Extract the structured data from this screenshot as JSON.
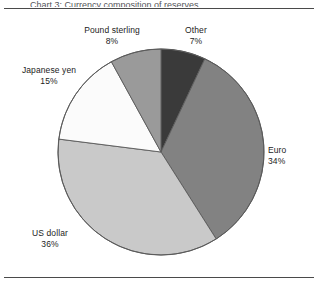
{
  "figure": {
    "title_remnant": "Chart 3: Currency composition of reserves",
    "background": "#ffffff",
    "rule_color": "#4a4a4a"
  },
  "chart_data": {
    "type": "pie",
    "title": "",
    "xlabel": "",
    "ylabel": "",
    "units": "percent",
    "start_angle_deg": 0,
    "direction": "clockwise",
    "legend": "none",
    "labels_placement": "outside-callout",
    "categories": [
      "Other",
      "Euro",
      "US dollar",
      "Japanese yen",
      "Pound sterling"
    ],
    "values": [
      7,
      34,
      36,
      15,
      8
    ],
    "total": 100,
    "slices": [
      {
        "label": "Other",
        "value": 7,
        "value_text": "7%",
        "color": "#3a3a3a",
        "start_deg": 0.0,
        "end_deg": 25.2
      },
      {
        "label": "Euro",
        "value": 34,
        "value_text": "34%",
        "color": "#828282",
        "start_deg": 25.2,
        "end_deg": 147.6
      },
      {
        "label": "US dollar",
        "value": 36,
        "value_text": "36%",
        "color": "#c9c9c9",
        "start_deg": 147.6,
        "end_deg": 277.2
      },
      {
        "label": "Japanese yen",
        "value": 15,
        "value_text": "15%",
        "color": "#fbfbfb",
        "start_deg": 277.2,
        "end_deg": 331.2
      },
      {
        "label": "Pound sterling",
        "value": 8,
        "value_text": "8%",
        "color": "#9a9a9a",
        "start_deg": 331.2,
        "end_deg": 360.0
      }
    ],
    "slice_edge_color": "#5a5a5a"
  },
  "labels": {
    "pound": {
      "name": "Pound sterling",
      "value": "8%"
    },
    "other": {
      "name": "Other",
      "value": "7%"
    },
    "yen": {
      "name": "Japanese yen",
      "value": "15%"
    },
    "euro": {
      "name": "Euro",
      "value": "34%"
    },
    "usd": {
      "name": "US dollar",
      "value": "36%"
    }
  }
}
